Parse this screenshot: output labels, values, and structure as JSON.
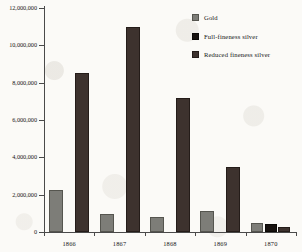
{
  "chart_data": {
    "type": "bar",
    "title": "",
    "subtitle": "",
    "xlabel": "",
    "ylabel": "",
    "categories": [
      "1866",
      "1867",
      "1868",
      "1869",
      "1870"
    ],
    "ylim": [
      0,
      12000000
    ],
    "ytick_values": [
      0,
      2000000,
      4000000,
      6000000,
      8000000,
      10000000,
      12000000
    ],
    "ytick_labels": [
      "0",
      "2,000,000",
      "4,000,000",
      "6,000,000",
      "8,000,000",
      "10,000,000",
      "12,000,000"
    ],
    "grid": false,
    "legend_position": "top-right",
    "series": [
      {
        "name": "Gold",
        "color": "#7d7d78",
        "values": [
          2250000,
          950000,
          800000,
          1150000,
          480000
        ]
      },
      {
        "name": "Full-fineness silver",
        "color": "#17120f",
        "values": [
          0,
          0,
          0,
          0,
          420000
        ]
      },
      {
        "name": "Reduced fineness silver",
        "color": "#3d322e",
        "values": [
          8500000,
          11000000,
          7200000,
          3500000,
          250000
        ]
      }
    ]
  },
  "legend": {
    "items": [
      {
        "label": "Gold",
        "swatch": "gold-swatch"
      },
      {
        "label": "Full-fineness silver",
        "swatch": "full-fineness-silver-swatch"
      },
      {
        "label": "Reduced fineness silver",
        "swatch": "reduced-fineness-silver-swatch"
      }
    ]
  }
}
